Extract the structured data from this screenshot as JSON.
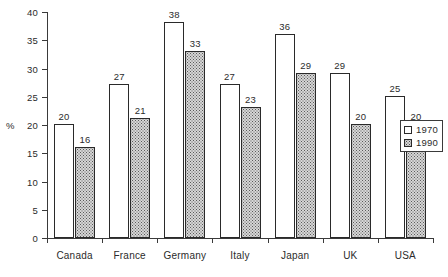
{
  "chart_data": {
    "type": "bar",
    "title": "",
    "xlabel": "",
    "ylabel": "%",
    "ylim": [
      0,
      40
    ],
    "ytick_step": 5,
    "grid": false,
    "legend_position": "right",
    "categories": [
      "Canada",
      "France",
      "Germany",
      "Italy",
      "Japan",
      "UK",
      "USA"
    ],
    "series": [
      {
        "name": "1970",
        "swatch": "empty-white",
        "color": "#ffffff",
        "values": [
          20,
          27,
          38,
          27,
          36,
          29,
          25
        ]
      },
      {
        "name": "1990",
        "swatch": "dotted-grey",
        "color": "#d6d6d6",
        "values": [
          16,
          21,
          33,
          23,
          29,
          20,
          20
        ]
      }
    ],
    "y_ticks": [
      0,
      5,
      10,
      15,
      20,
      25,
      30,
      35,
      40
    ],
    "y_tick_labels": [
      "0",
      "5",
      "10",
      "15",
      "20",
      "25",
      "30",
      "35",
      "40"
    ],
    "axis_unit_label": "%",
    "data_labels": {
      "1970": [
        "20",
        "27",
        "38",
        "27",
        "36",
        "29",
        "25"
      ],
      "1990": [
        "16",
        "21",
        "33",
        "23",
        "29",
        "20",
        "20"
      ]
    }
  },
  "legend": {
    "entries": [
      {
        "label": "1970",
        "style": "y1970"
      },
      {
        "label": "1990",
        "style": "y1990"
      }
    ]
  }
}
